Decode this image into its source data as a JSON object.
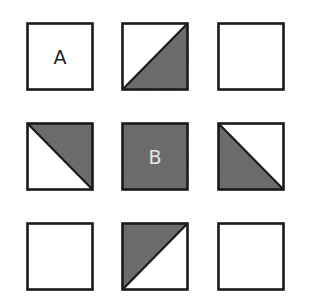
{
  "diagram": {
    "type": "3x3 shaded square grid puzzle",
    "colors": {
      "outline": "#1a1a1a",
      "shade": "#6e6e6e",
      "hatch": "#626262",
      "fill": "#ffffff"
    },
    "cells": [
      {
        "row": 0,
        "col": 0,
        "x": 26,
        "y": 22,
        "shading": "none",
        "label": "A",
        "label_color": "dark"
      },
      {
        "row": 0,
        "col": 1,
        "x": 121,
        "y": 22,
        "shading": "lower-right",
        "label": ""
      },
      {
        "row": 0,
        "col": 2,
        "x": 217,
        "y": 22,
        "shading": "none",
        "label": ""
      },
      {
        "row": 1,
        "col": 0,
        "x": 26,
        "y": 122,
        "shading": "upper-right",
        "label": ""
      },
      {
        "row": 1,
        "col": 1,
        "x": 121,
        "y": 122,
        "shading": "full",
        "label": "B",
        "label_color": "light"
      },
      {
        "row": 1,
        "col": 2,
        "x": 217,
        "y": 122,
        "shading": "lower-left",
        "label": ""
      },
      {
        "row": 2,
        "col": 0,
        "x": 26,
        "y": 222,
        "shading": "none",
        "label": ""
      },
      {
        "row": 2,
        "col": 1,
        "x": 121,
        "y": 222,
        "shading": "upper-left",
        "label": ""
      },
      {
        "row": 2,
        "col": 2,
        "x": 217,
        "y": 222,
        "shading": "none",
        "label": ""
      }
    ]
  }
}
